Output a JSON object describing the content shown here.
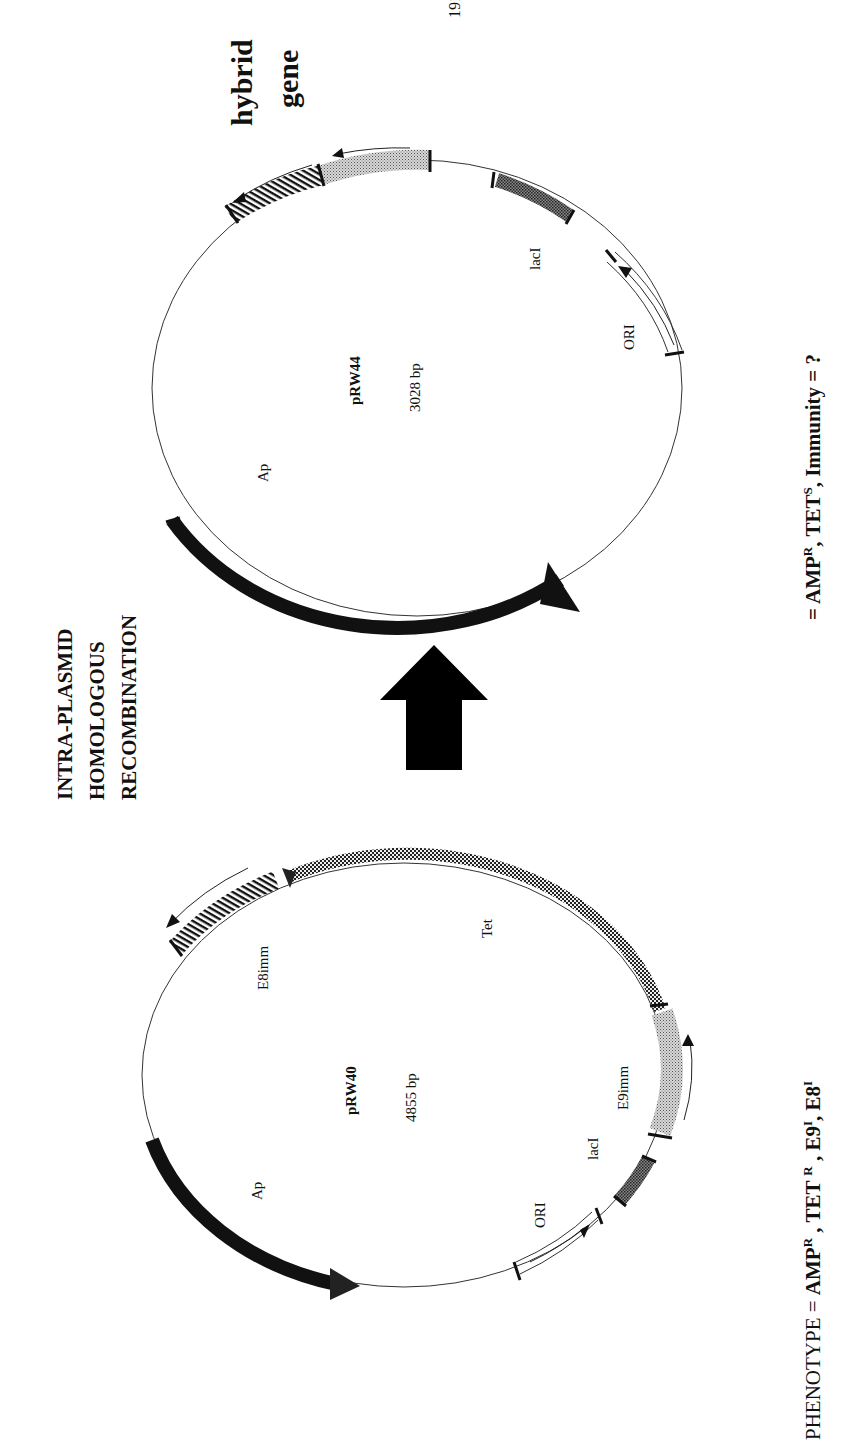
{
  "page": {
    "page_number": "191",
    "orientation": "rotated 90° counter-clockwise (text reads bottom-to-top)"
  },
  "process": {
    "line1": "INTRA-PLASMID",
    "line2": "HOMOLOGOUS",
    "line3": "RECOMBINATION",
    "arrow_icon": "block-arrow-up-icon"
  },
  "plasmid_before": {
    "name": "pRW40",
    "size": "4855 bp",
    "features": {
      "ap": "Ap",
      "e8imm": "E8imm",
      "tet": "Tet",
      "e9imm": "E9imm",
      "laci": "lacI",
      "ori": "ORI"
    },
    "phenotype": {
      "prefix": "PHENOTYPE = ",
      "text": "AMP",
      "amp_sup": "R",
      "sep1": " , TET ",
      "tet_sup": "R",
      "sep2": " , E9",
      "e9_sup": "I",
      "sep3": ", E8",
      "e8_sup": "I"
    }
  },
  "plasmid_after": {
    "name": "pRW44",
    "size": "3028 bp",
    "features": {
      "ap": "Ap",
      "laci": "lacI",
      "ori": "ORI"
    },
    "hybrid_label_1": "hybrid",
    "hybrid_label_2": "gene",
    "phenotype": {
      "prefix": "= AMP",
      "amp_sup": "R",
      "sep1": ", TET",
      "tet_sup": "S",
      "sep2": ",  Immunity = ?"
    }
  },
  "colors": {
    "ink": "#111111",
    "line": "#333333",
    "light_stipple": "#bdbdbd",
    "dark_stipple": "#6a6a6a"
  }
}
